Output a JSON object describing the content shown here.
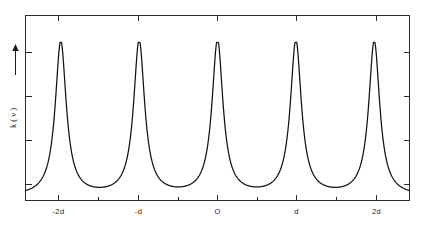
{
  "chart_data": {
    "type": "line",
    "title": "",
    "subtitle": "",
    "xlabel": "",
    "ylabel": "k ( ν )",
    "ylabel_arrow": "↑ increasing",
    "x_tick_labels": [
      "-2d",
      "-d",
      "O",
      "d",
      "2d"
    ],
    "x_tick_values": [
      -2,
      -1,
      0,
      1,
      2
    ],
    "x_minor_ticks": [
      -1.5,
      -0.5,
      0.5,
      1.5
    ],
    "y_tick_labels": [
      "",
      "",
      "",
      ""
    ],
    "y_tick_values": [
      0.85,
      0.6,
      0.36,
      0.11
    ],
    "xlim": [
      -2.45,
      2.45
    ],
    "ylim": [
      0,
      1
    ],
    "grid": false,
    "legend": null,
    "legend_position": "none",
    "annotations": [
      {
        "name": "y-axis-direction-arrow",
        "text": "↑",
        "description": "upward arrow on the y axis indicating increasing k(ν)"
      }
    ],
    "series": [
      {
        "name": "k(ν)",
        "color": "#111111",
        "peak_centers": [
          -2,
          -1,
          0,
          1,
          2
        ],
        "peak_height": 0.855,
        "baseline": 0.02,
        "peak_halfwidth": 0.085,
        "x": [
          -2.45,
          -2.4,
          -2.3,
          -2.2,
          -2.15,
          -2.1,
          -2.05,
          -2.0,
          -1.95,
          -1.9,
          -1.85,
          -1.8,
          -1.7,
          -1.6,
          -1.5,
          -1.4,
          -1.3,
          -1.2,
          -1.15,
          -1.1,
          -1.05,
          -1.0,
          -0.95,
          -0.9,
          -0.85,
          -0.8,
          -0.7,
          -0.6,
          -0.5,
          -0.4,
          -0.3,
          -0.2,
          -0.15,
          -0.1,
          -0.05,
          0.0,
          0.05,
          0.1,
          0.15,
          0.2,
          0.3,
          0.4,
          0.5,
          0.6,
          0.7,
          0.8,
          0.85,
          0.9,
          0.95,
          1.0,
          1.05,
          1.1,
          1.15,
          1.2,
          1.3,
          1.4,
          1.5,
          1.6,
          1.7,
          1.8,
          1.85,
          1.9,
          1.95,
          2.0,
          2.05,
          2.1,
          2.15,
          2.2,
          2.3,
          2.4,
          2.45
        ],
        "y": [
          0.14,
          0.18,
          0.32,
          0.6,
          0.74,
          0.82,
          0.85,
          0.855,
          0.85,
          0.82,
          0.74,
          0.6,
          0.26,
          0.11,
          0.05,
          0.11,
          0.26,
          0.6,
          0.74,
          0.82,
          0.85,
          0.855,
          0.85,
          0.82,
          0.74,
          0.6,
          0.26,
          0.11,
          0.05,
          0.11,
          0.26,
          0.6,
          0.74,
          0.82,
          0.85,
          0.855,
          0.85,
          0.82,
          0.74,
          0.6,
          0.26,
          0.11,
          0.05,
          0.11,
          0.26,
          0.6,
          0.74,
          0.82,
          0.85,
          0.855,
          0.85,
          0.82,
          0.74,
          0.6,
          0.26,
          0.11,
          0.05,
          0.11,
          0.26,
          0.6,
          0.74,
          0.82,
          0.85,
          0.855,
          0.85,
          0.82,
          0.74,
          0.6,
          0.32,
          0.18,
          0.14
        ]
      }
    ]
  },
  "figure": {
    "background_color": "#ffffff",
    "frame_color": "#2b2b2b",
    "curve_color": "#111111"
  }
}
